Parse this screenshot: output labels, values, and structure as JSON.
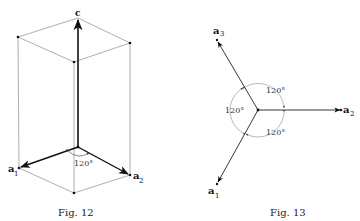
{
  "figures": [
    {
      "id": "fig12",
      "caption": "Fig. 12",
      "caption_small": "ig. 12",
      "caption_first": "F",
      "labels": {
        "c": "c",
        "a1": "a",
        "a1_sub": "1",
        "a2": "a",
        "a2_sub": "2",
        "angle": "120°"
      }
    },
    {
      "id": "fig13",
      "caption": "Fig. 13",
      "caption_small": "ig. 13",
      "caption_first": "F",
      "labels": {
        "a1": "a",
        "a1_sub": "1",
        "a2": "a",
        "a2_sub": "2",
        "a3": "a",
        "a3_sub": "3",
        "angle_top": "120°",
        "angle_left": "120°",
        "angle_bottom": "120°"
      }
    }
  ],
  "colors": {
    "axis": "#111111",
    "edge": "#9a9a9a",
    "arc": "#888888"
  }
}
